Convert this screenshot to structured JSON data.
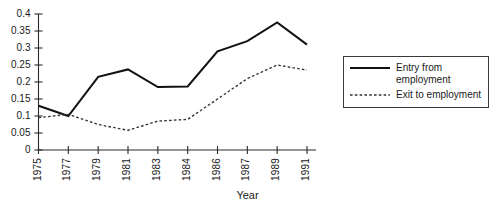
{
  "chart_data": {
    "type": "line",
    "title": "",
    "subtitle": "",
    "xlabel": "Year",
    "ylabel": "",
    "categories": [
      "1975",
      "1977",
      "1979",
      "1981",
      "1983",
      "1984",
      "1986",
      "1987",
      "1989",
      "1991"
    ],
    "x": [
      1975,
      1977,
      1979,
      1981,
      1983,
      1984,
      1986,
      1987,
      1989,
      1991
    ],
    "series": [
      {
        "name": "Entry from employment",
        "style": "solid",
        "color": "#111111",
        "values": [
          0.13,
          0.1,
          0.215,
          0.237,
          0.185,
          0.187,
          0.29,
          0.32,
          0.375,
          0.31
        ]
      },
      {
        "name": "Exit to employment",
        "style": "dashed",
        "color": "#333333",
        "values": [
          0.095,
          0.105,
          0.075,
          0.058,
          0.085,
          0.09,
          0.15,
          0.21,
          0.25,
          0.235
        ]
      }
    ],
    "ylim": [
      0,
      0.4
    ],
    "yticks": [
      0,
      0.05,
      0.1,
      0.15,
      0.2,
      0.25,
      0.3,
      0.35,
      0.4
    ],
    "ytick_labels": [
      "0",
      "0.05",
      "0.1",
      "0.15",
      "0.2",
      "0.25",
      "0.3",
      "0.35",
      "0.4"
    ],
    "grid": false,
    "legend_position": "right"
  },
  "legend": {
    "entries": [
      {
        "label": "Entry from employment",
        "style": "solid"
      },
      {
        "label": "Exit to employment",
        "style": "dashed"
      }
    ]
  },
  "axes": {
    "x_title": "Year"
  }
}
